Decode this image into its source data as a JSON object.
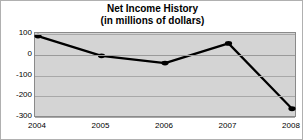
{
  "chart_data": {
    "type": "line",
    "title": "Net Income History",
    "subtitle": "(in millions of dollars)",
    "xlabel": "",
    "ylabel": "",
    "categories": [
      "2004",
      "2005",
      "2006",
      "2007",
      "2008"
    ],
    "values": [
      85,
      -10,
      -45,
      50,
      -265
    ],
    "series": [
      {
        "name": "Net Income",
        "values": [
          85,
          -10,
          -45,
          50,
          -265
        ]
      }
    ],
    "ylim": [
      -300,
      100
    ],
    "yticks": [
      100,
      0,
      -100,
      -200,
      -300
    ],
    "ytick_labels": [
      "100",
      "0",
      "-100",
      "-200",
      "-300"
    ],
    "xtick_labels": [
      "2004",
      "2005",
      "2006",
      "2007",
      "2008"
    ],
    "grid": true,
    "legend": false,
    "legend_position": "none",
    "line_color": "#000000",
    "marker": "circle",
    "marker_color": "#000000",
    "plot_background": "#d4d4d4",
    "frame_background": "#ffffff",
    "gridline_color": "#a8a8a8"
  }
}
